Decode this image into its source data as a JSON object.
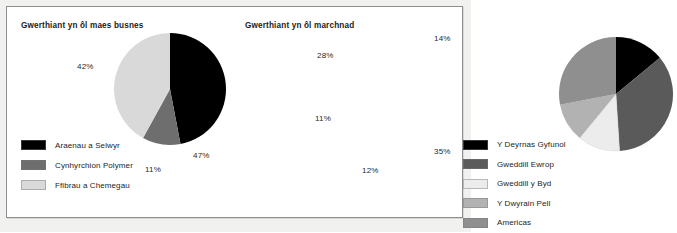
{
  "document": {
    "background_color": "#f1f1f0",
    "card_background": "#ffffff",
    "border_color": "#8e8e8e"
  },
  "chart_data": [
    {
      "type": "pie",
      "id": "sales-by-business-area",
      "title": "Gwerthiant yn ôl maes busnes",
      "xlabel": "",
      "ylabel": "",
      "legend_position": "bottom-left",
      "categories": [
        "Araenau a Selwyr",
        "Cynhyrchion Polymer",
        "Ffibrau a Chemegau"
      ],
      "values": [
        47,
        11,
        42
      ],
      "value_labels": [
        "47%",
        "11%",
        "42%"
      ],
      "colors": [
        "#000000",
        "#6e6e6e",
        "#d9d9d9"
      ],
      "start_angle_deg": 0,
      "direction": "clockwise"
    },
    {
      "type": "pie",
      "id": "sales-by-market",
      "title": "Gwerthiant yn ôl marchnad",
      "xlabel": "",
      "ylabel": "",
      "legend_position": "bottom-left",
      "categories": [
        "Y Deyrnas Gyfunol",
        "Gweddill Ewrop",
        "Gweddill y Byd",
        "Y Dwyrain Pell",
        "Americas"
      ],
      "values": [
        14,
        35,
        12,
        11,
        28
      ],
      "value_labels": [
        "14%",
        "35%",
        "12%",
        "11%",
        "28%"
      ],
      "colors": [
        "#000000",
        "#5a5a5a",
        "#ececec",
        "#b2b2b2",
        "#8f8f8f"
      ],
      "start_angle_deg": 0,
      "direction": "clockwise"
    }
  ],
  "left_chart": {
    "title": "Gwerthiant yn ôl maes busnes",
    "labels": {
      "black": "47%",
      "midgray": "11%",
      "lightgray": "42%"
    },
    "legend": [
      {
        "label": "Araenau a Selwyr",
        "color": "#000000"
      },
      {
        "label": "Cynhyrchion Polymer",
        "color": "#6e6e6e"
      },
      {
        "label": "Ffibrau a Chemegau",
        "color": "#d9d9d9"
      }
    ]
  },
  "right_chart": {
    "title": "Gwerthiant yn ôl marchnad",
    "labels": {
      "uk": "14%",
      "europe": "35%",
      "world": "12%",
      "fareast": "11%",
      "americas": "28%"
    },
    "legend": [
      {
        "label": "Y Deyrnas Gyfunol",
        "color": "#000000"
      },
      {
        "label": "Gweddill Ewrop",
        "color": "#5a5a5a"
      },
      {
        "label": "Gweddill y Byd",
        "color": "#ececec"
      },
      {
        "label": "Y Dwyrain Pell",
        "color": "#b2b2b2"
      },
      {
        "label": "Americas",
        "color": "#8f8f8f"
      }
    ]
  }
}
